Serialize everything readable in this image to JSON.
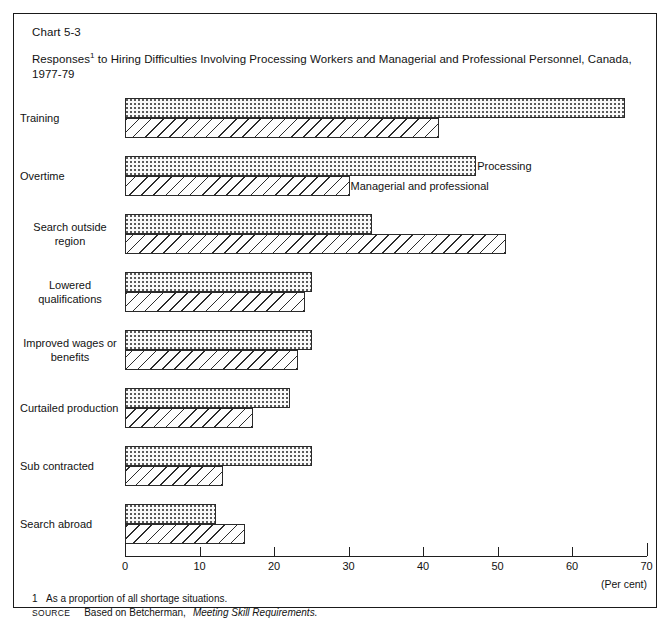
{
  "chart_number": "Chart 5-3",
  "title": "Responses1 to Hiring Difficulties Involving Processing Workers and Managerial and Professional Personnel, Canada, 1977-79",
  "title_line1_pre": "Responses",
  "title_footnote_marker": "1",
  "title_line1_post": " to Hiring Difficulties Involving Processing Workers and Managerial and Professional Personnel,",
  "title_line2": "Canada, 1977-79",
  "axis": {
    "unit_label": "(Per cent)",
    "tick_labels": [
      "0",
      "10",
      "20",
      "30",
      "40",
      "50",
      "60",
      "70"
    ],
    "min": 0,
    "max": 70
  },
  "legend": {
    "processing": "Processing",
    "managerial": "Managerial and professional"
  },
  "notes": {
    "footnote_marker": "1",
    "footnote_text": "As a proportion of all shortage situations.",
    "source_word": "Source",
    "source_text": "Based on Betcherman,",
    "source_title": "Meeting Skill Requirements."
  },
  "chart_data": {
    "type": "bar",
    "orientation": "horizontal",
    "xlabel": "(Per cent)",
    "ylabel": "",
    "xlim": [
      0,
      70
    ],
    "grid": false,
    "legend_position": "inline-overtime-group",
    "categories": [
      "Training",
      "Overtime",
      "Search outside region",
      "Lowered qualifications",
      "Improved wages or benefits",
      "Curtailed production",
      "Sub contracted",
      "Search abroad"
    ],
    "category_label_lines": [
      [
        "Training"
      ],
      [
        "Overtime"
      ],
      [
        "Search  outside",
        "region"
      ],
      [
        "Lowered",
        "qualifications"
      ],
      [
        "Improved wages or",
        "benefits"
      ],
      [
        "Curtailed production"
      ],
      [
        "Sub contracted"
      ],
      [
        "Search  abroad"
      ]
    ],
    "series": [
      {
        "name": "Processing",
        "pattern": "dotted",
        "values": [
          67,
          47,
          33,
          25,
          25,
          22,
          25,
          12
        ]
      },
      {
        "name": "Managerial and professional",
        "pattern": "diagonal-hatch",
        "values": [
          42,
          30,
          51,
          24,
          23,
          17,
          13,
          16
        ]
      }
    ]
  }
}
